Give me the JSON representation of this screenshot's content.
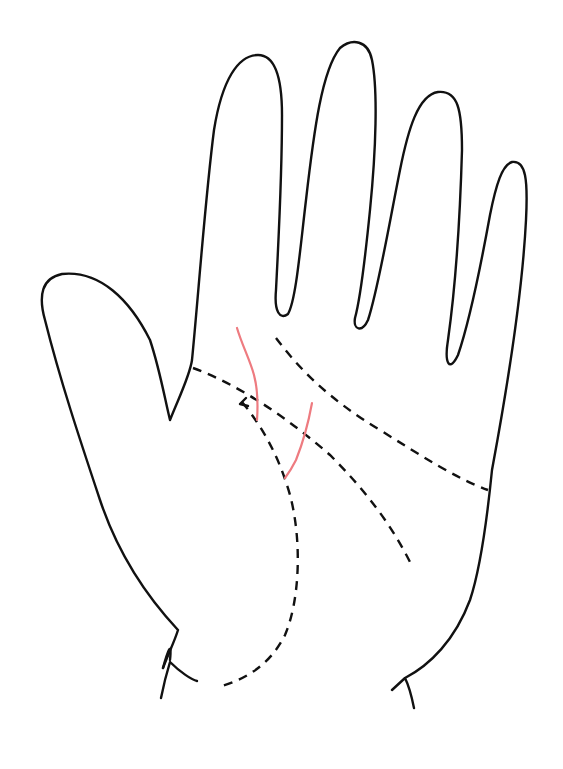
{
  "diagram": {
    "colors": {
      "background": "#ffffff",
      "outline": "#111111",
      "dashed_lines": "#111111",
      "highlight_lines": "#ee7b80"
    },
    "elements": [
      {
        "name": "hand-outline",
        "style": "solid",
        "color": "#111111"
      },
      {
        "name": "heart-line",
        "style": "dashed",
        "color": "#111111"
      },
      {
        "name": "head-line",
        "style": "dashed",
        "color": "#111111"
      },
      {
        "name": "life-line",
        "style": "dashed",
        "color": "#111111"
      },
      {
        "name": "red-line-upper",
        "style": "solid",
        "color": "#ee7b80"
      },
      {
        "name": "red-line-lower",
        "style": "solid",
        "color": "#ee7b80"
      }
    ]
  }
}
